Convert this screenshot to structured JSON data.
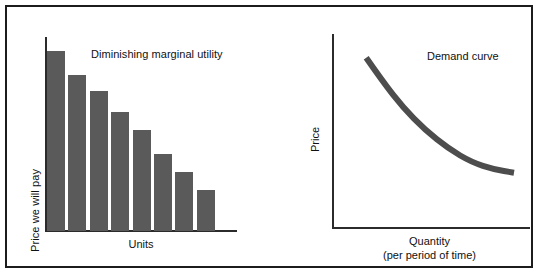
{
  "figure": {
    "width": 540,
    "height": 278,
    "frame_color": "#1c1c1c",
    "background": "#ffffff"
  },
  "panels": {
    "left": {
      "title": "Diminishing marginal utility",
      "ylabel": "Price we will pay",
      "xlabel": "Units"
    },
    "right": {
      "title": "Demand curve",
      "ylabel": "Price",
      "xlabel_line1": "Quantity",
      "xlabel_line2": "(per period of time)"
    }
  },
  "chart_data": [
    {
      "type": "bar",
      "title": "Diminishing marginal utility",
      "xlabel": "Units",
      "ylabel": "Price we will pay",
      "categories": [
        "1",
        "2",
        "3",
        "4",
        "5",
        "6",
        "7",
        "8"
      ],
      "values": [
        100,
        87,
        78,
        66,
        56,
        43,
        33,
        23
      ],
      "ylim": [
        0,
        108
      ],
      "bar_color": "#5a5a5a",
      "grid": false,
      "legend": false,
      "tick_labels_x": [],
      "tick_labels_y": []
    },
    {
      "type": "line",
      "title": "Demand curve",
      "xlabel": "Quantity (per period of time)",
      "ylabel": "Price",
      "x": [
        0.12,
        0.22,
        0.34,
        0.47,
        0.61,
        0.75,
        0.88,
        1.0
      ],
      "y": [
        0.92,
        0.78,
        0.63,
        0.5,
        0.39,
        0.31,
        0.27,
        0.25
      ],
      "line_color": "#4d4d4d",
      "line_width": 6,
      "grid": false,
      "legend": false,
      "tick_labels_x": [],
      "tick_labels_y": []
    }
  ]
}
